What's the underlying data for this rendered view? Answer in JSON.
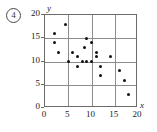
{
  "item": {
    "number": "4"
  },
  "chart_data": {
    "type": "scatter",
    "title": "",
    "xlabel": "x",
    "ylabel": "y",
    "xlim": [
      0,
      20
    ],
    "ylim": [
      0,
      20
    ],
    "xticks": [
      0,
      5,
      10,
      15,
      20
    ],
    "yticks": [
      0,
      5,
      10,
      15,
      20
    ],
    "xtick_labels": [
      "0",
      "5",
      "10",
      "15",
      "20"
    ],
    "ytick_labels": [
      "0",
      "5",
      "10",
      "15",
      "20"
    ],
    "grid": true,
    "grid_spacing": 5,
    "legend": null,
    "n_points": 22,
    "points": [
      {
        "x": 2,
        "y": 16
      },
      {
        "x": 2,
        "y": 14
      },
      {
        "x": 3,
        "y": 12
      },
      {
        "x": 4.5,
        "y": 18
      },
      {
        "x": 5,
        "y": 10
      },
      {
        "x": 6,
        "y": 12
      },
      {
        "x": 7,
        "y": 11
      },
      {
        "x": 7,
        "y": 9
      },
      {
        "x": 8,
        "y": 10
      },
      {
        "x": 8.5,
        "y": 13
      },
      {
        "x": 9,
        "y": 15
      },
      {
        "x": 9,
        "y": 10
      },
      {
        "x": 10,
        "y": 14
      },
      {
        "x": 10,
        "y": 10
      },
      {
        "x": 11,
        "y": 12
      },
      {
        "x": 11,
        "y": 11
      },
      {
        "x": 12,
        "y": 9
      },
      {
        "x": 12,
        "y": 7
      },
      {
        "x": 14,
        "y": 11
      },
      {
        "x": 16,
        "y": 8
      },
      {
        "x": 17,
        "y": 6
      },
      {
        "x": 18,
        "y": 3
      }
    ]
  }
}
